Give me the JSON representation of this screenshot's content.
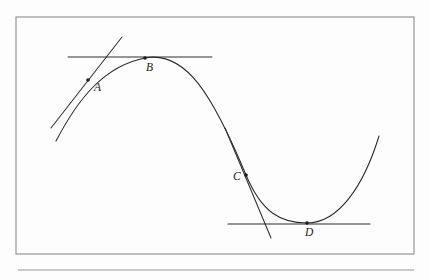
{
  "figure": {
    "background_color": "#fdfdfd",
    "curve_color": "#2a2a2a",
    "frame_color": "#8d8d8d",
    "rule_color": "#9a9a9a",
    "label_color": "#1a1a1a"
  },
  "frame": {
    "x": 16,
    "y": 17,
    "width": 398,
    "height": 237
  },
  "bottom_rule": {
    "x1": 18,
    "y1": 270,
    "x2": 414,
    "y2": 270
  },
  "curve": {
    "name": "sine-like-curve",
    "path": "M 56,141 C 78,99 104,66 145,58 C 186,50 213,96 246,175 C 262,213 281,223 307,223 C 339,223 364,185 379,136"
  },
  "points": [
    {
      "id": "A",
      "label": "A",
      "dot_x": 88,
      "dot_y": 80,
      "label_x": 94,
      "label_y": 91,
      "tangent": {
        "name": "tangent-line-a",
        "x1": 51,
        "y1": 128,
        "x2": 122,
        "y2": 37
      },
      "description": "inflection-side point with slanted tangent"
    },
    {
      "id": "B",
      "label": "B",
      "dot_x": 145,
      "dot_y": 58,
      "label_x": 146,
      "label_y": 71,
      "tangent": {
        "name": "tangent-line-b",
        "x1": 68,
        "y1": 57,
        "x2": 212,
        "y2": 57
      },
      "description": "local maximum with horizontal tangent"
    },
    {
      "id": "C",
      "label": "C",
      "dot_x": 246,
      "dot_y": 175,
      "label_x": 233,
      "label_y": 180,
      "tangent": {
        "name": "tangent-line-c",
        "x1": 225,
        "y1": 128,
        "x2": 271,
        "y2": 238
      },
      "description": "inflection-side point with steep descending tangent"
    },
    {
      "id": "D",
      "label": "D",
      "dot_x": 307,
      "dot_y": 223,
      "label_x": 305,
      "label_y": 236,
      "tangent": {
        "name": "tangent-line-d",
        "x1": 228,
        "y1": 224,
        "x2": 370,
        "y2": 224
      },
      "description": "local minimum with horizontal tangent"
    }
  ]
}
